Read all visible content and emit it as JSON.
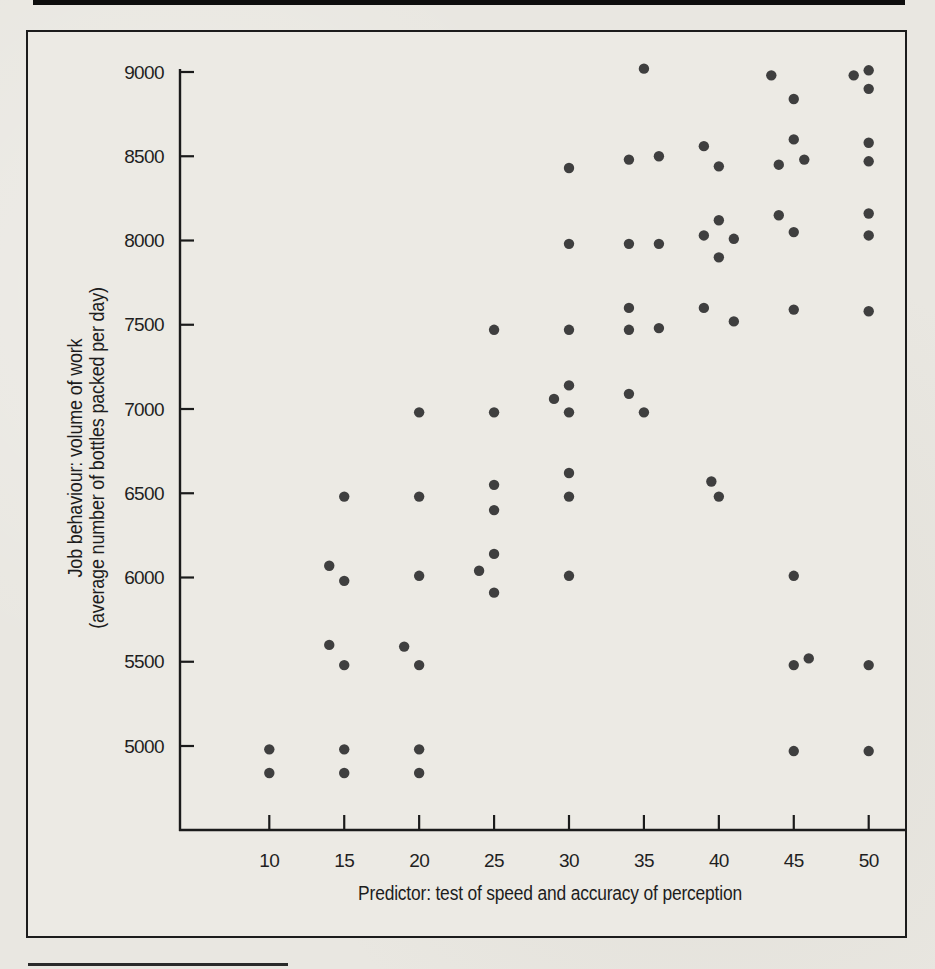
{
  "chart_data": {
    "type": "scatter",
    "xlabel": "Predictor: test of speed and accuracy of perception",
    "ylabel_line1": "Job behaviour: volume of work",
    "ylabel_line2": "(average number of bottles packed per day)",
    "x_ticks": [
      10,
      15,
      20,
      25,
      30,
      35,
      40,
      45,
      50
    ],
    "y_ticks": [
      5000,
      5500,
      6000,
      6500,
      7000,
      7500,
      8000,
      8500,
      9000
    ],
    "xlim": [
      4,
      52.5
    ],
    "ylim": [
      4280,
      9040
    ],
    "grid": false,
    "legend": "none",
    "colors": {
      "dot": "#3f3f3f",
      "axis": "#1b1b1b",
      "ink": "#1f1f1f"
    },
    "points": [
      [
        10,
        4980
      ],
      [
        10,
        4840
      ],
      [
        14,
        6070
      ],
      [
        14,
        5600
      ],
      [
        15,
        6480
      ],
      [
        15,
        5980
      ],
      [
        15,
        5480
      ],
      [
        15,
        4980
      ],
      [
        15,
        4840
      ],
      [
        19,
        5590
      ],
      [
        20,
        6980
      ],
      [
        20,
        6480
      ],
      [
        20,
        6010
      ],
      [
        20,
        5480
      ],
      [
        20,
        4980
      ],
      [
        20,
        4840
      ],
      [
        24,
        6040
      ],
      [
        25,
        7470
      ],
      [
        25,
        6980
      ],
      [
        25,
        6550
      ],
      [
        25,
        6400
      ],
      [
        25,
        6140
      ],
      [
        25,
        5910
      ],
      [
        29,
        7060
      ],
      [
        30,
        8430
      ],
      [
        30,
        7980
      ],
      [
        30,
        7470
      ],
      [
        30,
        7140
      ],
      [
        30,
        6980
      ],
      [
        30,
        6620
      ],
      [
        30,
        6480
      ],
      [
        30,
        6010
      ],
      [
        34,
        8480
      ],
      [
        34,
        7980
      ],
      [
        34,
        7600
      ],
      [
        34,
        7470
      ],
      [
        34,
        7090
      ],
      [
        35,
        9020
      ],
      [
        35,
        6980
      ],
      [
        36,
        8500
      ],
      [
        36,
        7980
      ],
      [
        36,
        7480
      ],
      [
        39,
        8560
      ],
      [
        39,
        8030
      ],
      [
        39,
        7600
      ],
      [
        39.5,
        6570
      ],
      [
        40,
        8440
      ],
      [
        40,
        8120
      ],
      [
        40,
        7900
      ],
      [
        40,
        6480
      ],
      [
        41,
        8010
      ],
      [
        41,
        7520
      ],
      [
        43.5,
        8980
      ],
      [
        44,
        8450
      ],
      [
        44,
        8150
      ],
      [
        45,
        8840
      ],
      [
        45,
        8600
      ],
      [
        45,
        8050
      ],
      [
        45,
        7590
      ],
      [
        45,
        6010
      ],
      [
        45,
        5480
      ],
      [
        45,
        4970
      ],
      [
        45.7,
        8480
      ],
      [
        46,
        5520
      ],
      [
        49,
        8980
      ],
      [
        50,
        9010
      ],
      [
        50,
        8900
      ],
      [
        50,
        8580
      ],
      [
        50,
        8470
      ],
      [
        50,
        8160
      ],
      [
        50,
        8030
      ],
      [
        50,
        7580
      ],
      [
        50,
        5480
      ],
      [
        50,
        4970
      ]
    ]
  }
}
